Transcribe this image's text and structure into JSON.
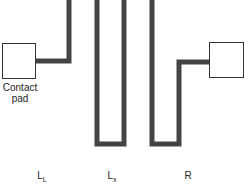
{
  "colors": {
    "trace": "#444444",
    "pad_stroke": "#333333",
    "pad_fill": "#ffffff"
  },
  "pad_label": {
    "line1": "Contact",
    "line2": "pad"
  },
  "components": [
    {
      "main": "L",
      "sub": "L"
    },
    {
      "main": "L",
      "sub": "x"
    },
    {
      "main": "R",
      "sub": ""
    }
  ]
}
